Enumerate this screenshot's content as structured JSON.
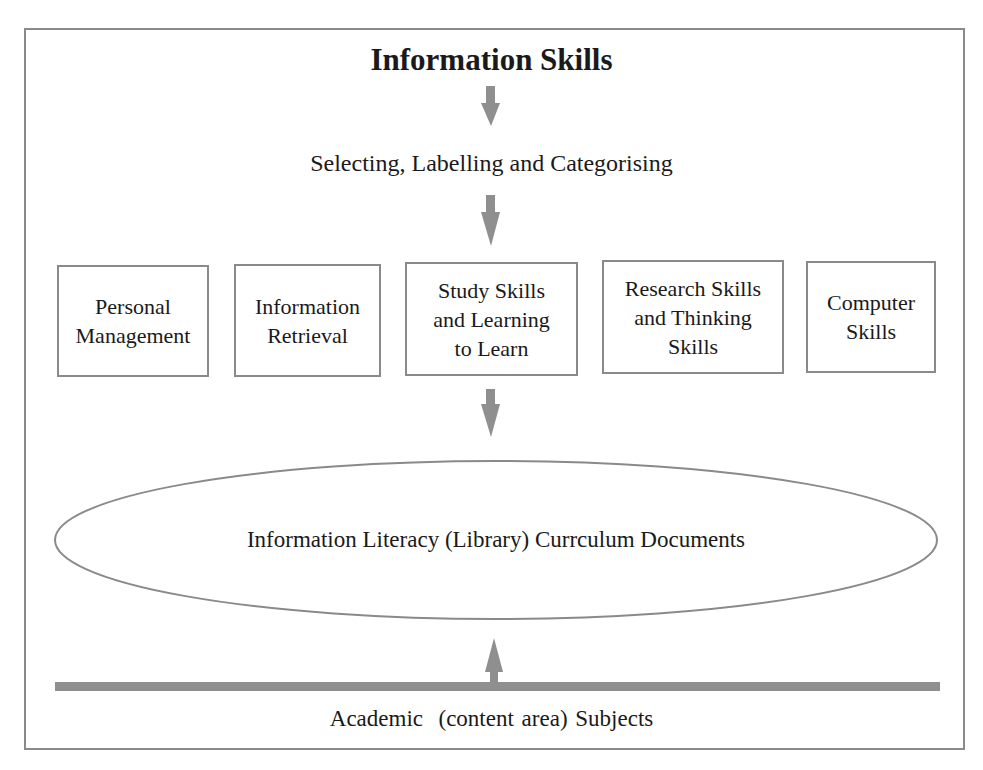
{
  "diagram": {
    "title": "Information Skills",
    "process_step": "Selecting, Labelling and Categorising",
    "categories": [
      {
        "label": "Personal\nManagement"
      },
      {
        "label": "Information\nRetrieval"
      },
      {
        "label": "Study Skills\nand Learning\nto Learn"
      },
      {
        "label": "Research Skills\nand Thinking\nSkills"
      },
      {
        "label": "Computer\nSkills"
      }
    ],
    "outcome": "Information Literacy (Library) Currculum Documents",
    "foundation": "Academic  (content area) Subjects",
    "colors": {
      "frame": "#8a8a8a",
      "arrow": "#8f8f8f",
      "bar": "#8f8f8f",
      "text": "#1a1a1a"
    }
  }
}
